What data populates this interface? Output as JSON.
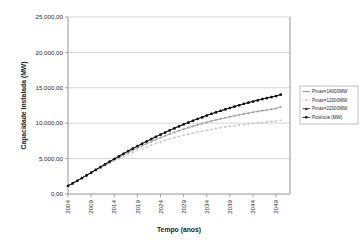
{
  "chart_data": {
    "type": "line",
    "title": "",
    "xlabel": "Tempo (anos)",
    "ylabel": "Capacidade Instalada (MW)",
    "xlim": [
      2004,
      2052
    ],
    "ylim": [
      0,
      25000
    ],
    "grid": true,
    "legend_position": "right",
    "x_tick_labels": [
      "2004",
      "2009",
      "2014",
      "2019",
      "2024",
      "2029",
      "2034",
      "2039",
      "2044",
      "2049"
    ],
    "x_ticks": [
      2004,
      2009,
      2014,
      2019,
      2024,
      2029,
      2034,
      2039,
      2044,
      2049
    ],
    "y_tick_labels": [
      "0,00",
      "5.000,00",
      "10.000,00",
      "15.000,00",
      "20.000,00",
      "25.000,00"
    ],
    "y_ticks": [
      0,
      5000,
      10000,
      15000,
      20000,
      25000
    ],
    "x": [
      2004,
      2005,
      2006,
      2007,
      2008,
      2009,
      2010,
      2011,
      2012,
      2013,
      2014,
      2015,
      2016,
      2017,
      2018,
      2019,
      2020,
      2021,
      2022,
      2023,
      2024,
      2025,
      2026,
      2027,
      2028,
      2029,
      2030,
      2031,
      2032,
      2033,
      2034,
      2035,
      2036,
      2037,
      2038,
      2039,
      2040,
      2041,
      2042,
      2043,
      2044,
      2045,
      2046,
      2047,
      2048,
      2049,
      2050
    ],
    "series": [
      {
        "name": "Pmax=14000MW",
        "color": "#9b9b9b",
        "marker": "cross",
        "line_style": "solid",
        "values": [
          1150,
          1500,
          1860,
          2230,
          2600,
          2980,
          3360,
          3730,
          4100,
          4460,
          4820,
          5170,
          5520,
          5860,
          6190,
          6510,
          6820,
          7120,
          7410,
          7690,
          7960,
          8220,
          8470,
          8710,
          8940,
          9160,
          9370,
          9570,
          9760,
          9950,
          10130,
          10300,
          10460,
          10620,
          10770,
          10910,
          11050,
          11180,
          11310,
          11430,
          11550,
          11660,
          11770,
          11870,
          11970,
          12070,
          12300
        ]
      },
      {
        "name": "Pmax=12000MW",
        "color": "#c2c2c2",
        "marker": "dot",
        "line_style": "dotted",
        "values": [
          1150,
          1490,
          1840,
          2200,
          2560,
          2920,
          3280,
          3630,
          3980,
          4320,
          4650,
          4970,
          5280,
          5580,
          5870,
          6150,
          6410,
          6660,
          6900,
          7130,
          7350,
          7560,
          7750,
          7940,
          8120,
          8290,
          8450,
          8600,
          8740,
          8880,
          9010,
          9130,
          9250,
          9360,
          9460,
          9560,
          9650,
          9740,
          9820,
          9900,
          9970,
          10040,
          10110,
          10170,
          10230,
          10280,
          10400
        ]
      },
      {
        "name": "Pmax=22000MW",
        "color": "#2f2f2f",
        "marker": "triangle",
        "line_style": "solid",
        "values": [
          1150,
          1510,
          1880,
          2260,
          2640,
          3030,
          3420,
          3810,
          4200,
          4580,
          4960,
          5330,
          5700,
          6060,
          6420,
          6770,
          7110,
          7440,
          7770,
          8090,
          8400,
          8700,
          9000,
          9290,
          9570,
          9840,
          10100,
          10360,
          10610,
          10850,
          11090,
          11320,
          11540,
          11750,
          11960,
          12160,
          12360,
          12550,
          12730,
          12910,
          13080,
          13250,
          13410,
          13560,
          13710,
          13850,
          14050
        ]
      },
      {
        "name": "Potência (MW)",
        "color": "#111111",
        "marker": "circle",
        "line_style": "solid",
        "values": [
          1150,
          1510,
          1880,
          2260,
          2640,
          3030,
          3420,
          3810,
          4200,
          4580,
          4960,
          5330,
          5700,
          6060,
          6420,
          6770,
          7110,
          7440,
          7770,
          8090,
          8400,
          8700,
          9000,
          9290,
          9570,
          9840,
          10100,
          10360,
          10610,
          10850,
          11090,
          11320,
          11540,
          11750,
          11960,
          12160,
          12360,
          12550,
          12730,
          12910,
          13080,
          13250,
          13410,
          13560,
          13710,
          13850,
          14050
        ]
      }
    ]
  },
  "layout": {
    "plot_left": 68,
    "plot_right": 290,
    "plot_top": 17,
    "plot_bottom": 194,
    "legend_left": 300,
    "legend_top": 86,
    "legend_width": 58,
    "legend_height": 38
  }
}
